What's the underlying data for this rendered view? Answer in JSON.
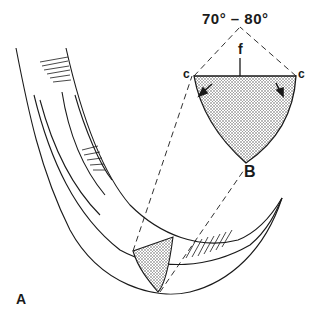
{
  "figure": {
    "panel_label": "A",
    "angle_label": "70° – 80°",
    "labels": {
      "f": "f",
      "c_left": "c",
      "c_right": "c",
      "B": "B"
    },
    "colors": {
      "ink": "#1a1a1a",
      "stipple": "#b8b8b8",
      "background": "#ffffff"
    }
  }
}
